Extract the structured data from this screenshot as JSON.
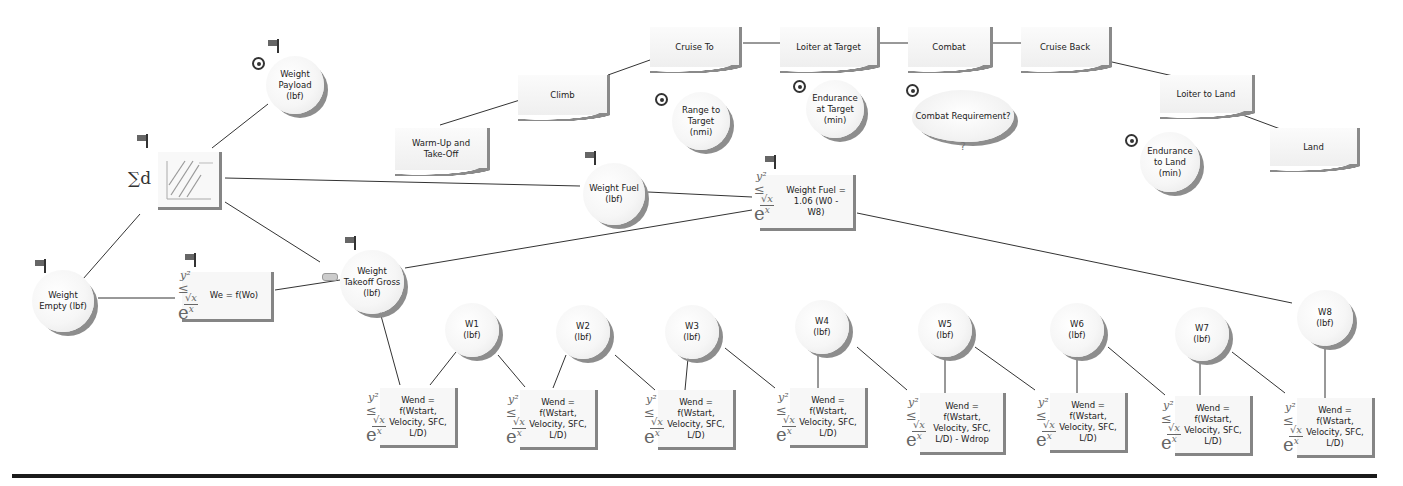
{
  "diagram": {
    "type": "influence-diagram",
    "mission_phases": [
      {
        "id": "warmup",
        "label": "Warm-Up and Take-Off"
      },
      {
        "id": "climb",
        "label": "Climb"
      },
      {
        "id": "cruise_to",
        "label": "Cruise To"
      },
      {
        "id": "loiter_target",
        "label": "Loiter at Target"
      },
      {
        "id": "combat",
        "label": "Combat"
      },
      {
        "id": "cruise_back",
        "label": "Cruise Back"
      },
      {
        "id": "loiter_land",
        "label": "Loiter to Land"
      },
      {
        "id": "land",
        "label": "Land"
      }
    ],
    "inputs": {
      "range": {
        "label": "Range to Target (nmi)"
      },
      "endurance_target": {
        "label": "Endurance at Target (min)"
      },
      "combat_req": {
        "label": "Combat Requirement?"
      },
      "endurance_land": {
        "label": "Endurance to Land (min)"
      },
      "payload": {
        "label": "Weight Payload (lbf)"
      }
    },
    "variables": {
      "weight_empty": {
        "label": "Weight Empty (lbf)"
      },
      "weight_gross": {
        "label": "Weight Takeoff Gross (lbf)"
      },
      "weight_fuel": {
        "label": "Weight Fuel (lbf)"
      },
      "w1": {
        "label": "W1 (lbf)"
      },
      "w2": {
        "label": "W2 (lbf)"
      },
      "w3": {
        "label": "W3 (lbf)"
      },
      "w4": {
        "label": "W4 (lbf)"
      },
      "w5": {
        "label": "W5 (lbf)"
      },
      "w6": {
        "label": "W6 (lbf)"
      },
      "w7": {
        "label": "W7 (lbf)"
      },
      "w8": {
        "label": "W8 (lbf)"
      }
    },
    "functions": {
      "we": {
        "label": "We = f(Wo)"
      },
      "fuel": {
        "label": "Weight Fuel = 1.06 (W0 - W8)"
      },
      "wend1": {
        "label": "Wend = f(Wstart, Velocity, SFC, L/D)"
      },
      "wend2": {
        "label": "Wend = f(Wstart, Velocity, SFC, L/D)"
      },
      "wend3": {
        "label": "Wend = f(Wstart, Velocity, SFC, L/D)"
      },
      "wend4": {
        "label": "Wend = f(Wstart, Velocity, SFC, L/D)"
      },
      "wend5": {
        "label": "Wend = f(Wstart, Velocity, SFC, L/D) - Wdrop"
      },
      "wend6": {
        "label": "Wend = f(Wstart, Velocity, SFC, L/D)"
      },
      "wend7": {
        "label": "Wend = f(Wstart, Velocity, SFC, L/D)"
      },
      "wend8": {
        "label": "Wend = f(Wstart, Velocity, SFC, L/D)"
      }
    },
    "sum_node": {
      "symbol": "∑d"
    },
    "eq_icon": {
      "y2": "y²",
      "le": "≤",
      "vx": "√x",
      "e": "e",
      "ex": "x"
    },
    "colors": {
      "shadow": "#8a8a8a",
      "line": "#333333",
      "divider": "#1a1a1a",
      "node_fill": "#f6f6f6"
    }
  }
}
